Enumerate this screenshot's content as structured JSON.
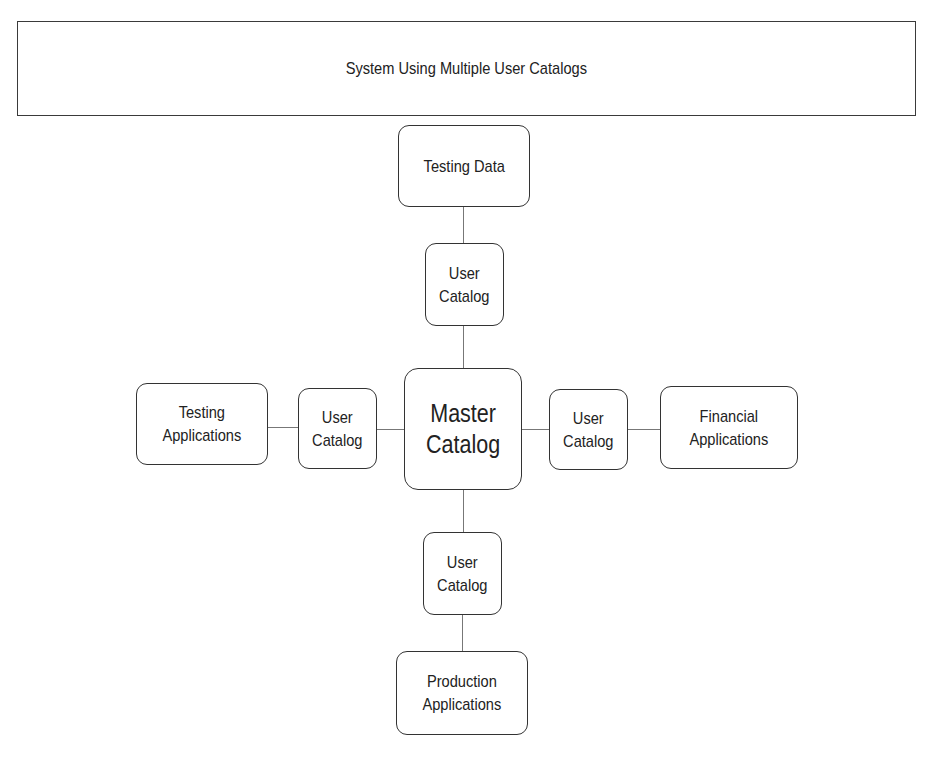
{
  "title": "System Using Multiple User Catalogs",
  "diagram": {
    "center": {
      "id": "master",
      "label": "Master\nCatalog"
    },
    "nodes": [
      {
        "id": "testing-data",
        "label": "Testing Data"
      },
      {
        "id": "user-catalog-top",
        "label": "User\nCatalog"
      },
      {
        "id": "testing-applications",
        "label": "Testing\nApplications"
      },
      {
        "id": "user-catalog-left",
        "label": "User\nCatalog"
      },
      {
        "id": "user-catalog-right",
        "label": "User\nCatalog"
      },
      {
        "id": "financial-applications",
        "label": "Financial\nApplications"
      },
      {
        "id": "user-catalog-bottom",
        "label": "User\nCatalog"
      },
      {
        "id": "production-applications",
        "label": "Production\nApplications"
      }
    ],
    "edges": [
      [
        "testing-data",
        "user-catalog-top"
      ],
      [
        "user-catalog-top",
        "master"
      ],
      [
        "testing-applications",
        "user-catalog-left"
      ],
      [
        "user-catalog-left",
        "master"
      ],
      [
        "master",
        "user-catalog-right"
      ],
      [
        "user-catalog-right",
        "financial-applications"
      ],
      [
        "master",
        "user-catalog-bottom"
      ],
      [
        "user-catalog-bottom",
        "production-applications"
      ]
    ]
  }
}
